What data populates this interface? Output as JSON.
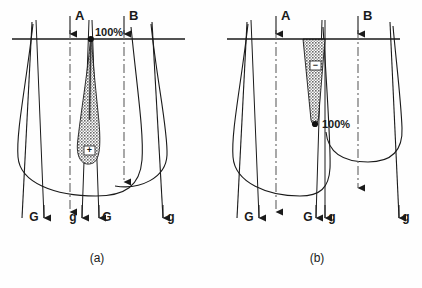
{
  "figure": {
    "type": "scientific-diagram",
    "background_color": "#fefefe",
    "ink_color": "#1a1a1a",
    "shade_fill": "#8c8c8c"
  },
  "panels": [
    {
      "id": "a",
      "caption": "(a)",
      "percent_label": "100%",
      "percent_position": "top",
      "shade_marker": "+",
      "shade_shape": "teardrop",
      "vertical_axes": [
        {
          "label": "A",
          "name": "axis-a"
        },
        {
          "label": "B",
          "name": "axis-b"
        }
      ],
      "gene_labels": [
        {
          "text": "G",
          "name": "gene-label-g-left"
        },
        {
          "text": "g",
          "name": "gene-label-g-inner-left"
        },
        {
          "text": "G",
          "name": "gene-label-g-inner-right"
        },
        {
          "text": "g",
          "name": "gene-label-g-right"
        }
      ]
    },
    {
      "id": "b",
      "caption": "(b)",
      "percent_label": "100%",
      "percent_position": "bottom",
      "shade_marker": "−",
      "shade_shape": "inverted-triangle",
      "vertical_axes": [
        {
          "label": "A",
          "name": "axis-a"
        },
        {
          "label": "B",
          "name": "axis-b"
        }
      ],
      "gene_labels": [
        {
          "text": "G",
          "name": "gene-label-g-left"
        },
        {
          "text": "G",
          "name": "gene-label-g-inner-left"
        },
        {
          "text": "g",
          "name": "gene-label-g-inner-right"
        },
        {
          "text": "g",
          "name": "gene-label-g-right"
        }
      ]
    }
  ]
}
